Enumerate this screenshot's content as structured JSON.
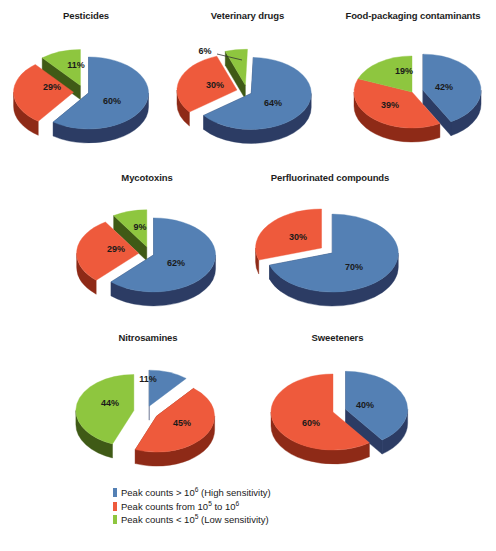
{
  "figure": {
    "background": "#ffffff",
    "width": 496,
    "height": 551
  },
  "colors": {
    "blue_top": "#5480b4",
    "blue_side": "#2c3c64",
    "red_top": "#ee5a3c",
    "red_side": "#8e2a17",
    "green_top": "#8dc councilor",
    "green_top_hex": "#8ec63f",
    "green_side": "#3f5a16"
  },
  "legend": {
    "items": [
      {
        "color": "#5480b4",
        "name": "legend-high-sensitivity",
        "text_pre": "Peak counts > 10",
        "sup": "6",
        "text_post": " (High sensitivity)"
      },
      {
        "color": "#ee5a3c",
        "name": "legend-mid-sensitivity",
        "text_pre": "Peak counts from 10",
        "sup": "5",
        "text_post": " to 10",
        "sup2": "6",
        "text_post2": ""
      },
      {
        "color": "#8ec63f",
        "name": "legend-low-sensitivity",
        "text_pre": "Peak counts < 10",
        "sup": "5",
        "text_post": " (Low sensitivity)"
      }
    ]
  },
  "chart_data": [
    {
      "type": "pie",
      "title": "Pesticides",
      "categories": [
        "Peak counts > 10^6 (High sensitivity)",
        "Peak counts from 10^5 to 10^6",
        "Peak counts < 10^5 (Low sensitivity)"
      ],
      "labels": [
        "60%",
        "29%",
        "11%"
      ],
      "values": [
        60,
        29,
        11
      ],
      "colors": [
        "#5480b4",
        "#ee5a3c",
        "#8ec63f"
      ],
      "exploded": [
        false,
        true,
        true
      ],
      "legend_position": "bottom"
    },
    {
      "type": "pie",
      "title": "Veterinary drugs",
      "categories": [
        "Peak counts > 10^6 (High sensitivity)",
        "Peak counts from 10^5 to 10^6",
        "Peak counts < 10^5 (Low sensitivity)"
      ],
      "labels": [
        "64%",
        "30%",
        "6%"
      ],
      "values": [
        64,
        30,
        6
      ],
      "colors": [
        "#5480b4",
        "#ee5a3c",
        "#8ec63f"
      ],
      "exploded": [
        false,
        true,
        true
      ],
      "legend_position": "bottom"
    },
    {
      "type": "pie",
      "title": "Food-packaging contaminants",
      "categories": [
        "Peak counts > 10^6 (High sensitivity)",
        "Peak counts from 10^5 to 10^6",
        "Peak counts < 10^5 (Low sensitivity)"
      ],
      "labels": [
        "42%",
        "39%",
        "19%"
      ],
      "values": [
        42,
        39,
        19
      ],
      "colors": [
        "#5480b4",
        "#ee5a3c",
        "#8ec63f"
      ],
      "exploded": [
        true,
        false,
        false
      ],
      "legend_position": "bottom"
    },
    {
      "type": "pie",
      "title": "Mycotoxins",
      "categories": [
        "Peak counts > 10^6 (High sensitivity)",
        "Peak counts from 10^5 to 10^6",
        "Peak counts < 10^5 (Low sensitivity)"
      ],
      "labels": [
        "62%",
        "29%",
        "9%"
      ],
      "values": [
        62,
        29,
        9
      ],
      "colors": [
        "#5480b4",
        "#ee5a3c",
        "#8ec63f"
      ],
      "exploded": [
        false,
        true,
        true
      ],
      "legend_position": "bottom"
    },
    {
      "type": "pie",
      "title": "Perfluorinated compounds",
      "categories": [
        "Peak counts > 10^6 (High sensitivity)",
        "Peak counts from 10^5 to 10^6"
      ],
      "labels": [
        "70%",
        "30%"
      ],
      "values": [
        70,
        30
      ],
      "colors": [
        "#5480b4",
        "#ee5a3c"
      ],
      "exploded": [
        false,
        true
      ],
      "legend_position": "bottom"
    },
    {
      "type": "pie",
      "title": "Nitrosamines",
      "categories": [
        "Peak counts > 10^6 (High sensitivity)",
        "Peak counts from 10^5 to 10^6",
        "Peak counts < 10^5 (Low sensitivity)"
      ],
      "labels": [
        "11%",
        "45%",
        "44%"
      ],
      "values": [
        11,
        45,
        44
      ],
      "colors": [
        "#5480b4",
        "#ee5a3c",
        "#8ec63f"
      ],
      "exploded": [
        true,
        true,
        true
      ],
      "legend_position": "bottom"
    },
    {
      "type": "pie",
      "title": "Sweeteners",
      "categories": [
        "Peak counts > 10^6 (High sensitivity)",
        "Peak counts from 10^5 to 10^6"
      ],
      "labels": [
        "40%",
        "60%"
      ],
      "values": [
        40,
        60
      ],
      "colors": [
        "#5480b4",
        "#ee5a3c"
      ],
      "exploded": [
        true,
        false
      ],
      "legend_position": "bottom"
    }
  ],
  "panels": [
    {
      "name": "pie-pesticides",
      "title": "Pesticides",
      "box": {
        "left": 6,
        "top": 10,
        "width": 160,
        "height": 145
      },
      "cx": 78,
      "cy": 82,
      "rx": 60,
      "ry": 36,
      "depth": 14,
      "start_angle": -90,
      "slices": [
        {
          "label": "60%",
          "value": 60,
          "color_top": "#5480b4",
          "color_side": "#2c3c64",
          "explode": 5,
          "lx": 28,
          "ly": 10
        },
        {
          "label": "29%",
          "value": 29,
          "color_top": "#ee5a3c",
          "color_side": "#8e2a17",
          "explode": 11,
          "lx": -32,
          "ly": -4
        },
        {
          "label": "11%",
          "value": 11,
          "color_top": "#8ec63f",
          "color_side": "#3f5a16",
          "explode": 11,
          "lx": -8,
          "ly": -26
        }
      ],
      "leader": null
    },
    {
      "name": "pie-veterinary-drugs",
      "title": "Veterinary drugs",
      "box": {
        "left": 165,
        "top": 10,
        "width": 165,
        "height": 145
      },
      "cx": 82,
      "cy": 82,
      "rx": 60,
      "ry": 36,
      "depth": 14,
      "start_angle": -88,
      "slices": [
        {
          "label": "64%",
          "value": 64,
          "color_top": "#5480b4",
          "color_side": "#2c3c64",
          "explode": 5,
          "lx": 26,
          "ly": 12
        },
        {
          "label": "30%",
          "value": 30,
          "color_top": "#ee5a3c",
          "color_side": "#8e2a17",
          "explode": 11,
          "lx": -32,
          "ly": -6
        },
        {
          "label": "6%",
          "value": 6,
          "color_top": "#8ec63f",
          "color_side": "#3f5a16",
          "explode": 11,
          "lx": -42,
          "ly": -40
        }
      ],
      "leader": {
        "x1": -30,
        "y1": -38,
        "x2": -5,
        "y2": -32
      }
    },
    {
      "name": "pie-food-packaging-contaminants",
      "title": "Food-packaging contaminants",
      "box": {
        "left": 330,
        "top": 10,
        "width": 166,
        "height": 150
      },
      "cx": 82,
      "cy": 82,
      "rx": 58,
      "ry": 36,
      "depth": 14,
      "start_angle": -90,
      "slices": [
        {
          "label": "42%",
          "value": 42,
          "color_top": "#5480b4",
          "color_side": "#2c3c64",
          "explode": 12,
          "lx": 32,
          "ly": -4
        },
        {
          "label": "39%",
          "value": 39,
          "color_top": "#ee5a3c",
          "color_side": "#8e2a17",
          "explode": 0,
          "lx": -22,
          "ly": 14
        },
        {
          "label": "19%",
          "value": 19,
          "color_top": "#8ec63f",
          "color_side": "#3f5a16",
          "explode": 0,
          "lx": -8,
          "ly": -20
        }
      ],
      "leader": null
    },
    {
      "name": "pie-mycotoxins",
      "title": "Mycotoxins",
      "box": {
        "left": 62,
        "top": 172,
        "width": 170,
        "height": 145
      },
      "cx": 88,
      "cy": 82,
      "rx": 62,
      "ry": 37,
      "depth": 14,
      "start_angle": -90,
      "slices": [
        {
          "label": "62%",
          "value": 62,
          "color_top": "#5480b4",
          "color_side": "#2c3c64",
          "explode": 4,
          "lx": 26,
          "ly": 10
        },
        {
          "label": "29%",
          "value": 29,
          "color_top": "#ee5a3c",
          "color_side": "#8e2a17",
          "explode": 12,
          "lx": -34,
          "ly": -4
        },
        {
          "label": "9%",
          "value": 9,
          "color_top": "#8ec63f",
          "color_side": "#3f5a16",
          "explode": 12,
          "lx": -10,
          "ly": -26
        }
      ],
      "leader": null
    },
    {
      "name": "pie-perfluorinated-compounds",
      "title": "Perfluorinated compounds",
      "box": {
        "left": 240,
        "top": 172,
        "width": 180,
        "height": 145
      },
      "cx": 90,
      "cy": 80,
      "rx": 66,
      "ry": 39,
      "depth": 14,
      "start_angle": -90,
      "slices": [
        {
          "label": "70%",
          "value": 70,
          "color_top": "#5480b4",
          "color_side": "#2c3c64",
          "explode": 3,
          "lx": 24,
          "ly": 16
        },
        {
          "label": "30%",
          "value": 30,
          "color_top": "#ee5a3c",
          "color_side": "#8e2a17",
          "explode": 11,
          "lx": -32,
          "ly": -14
        }
      ],
      "leader": null
    },
    {
      "name": "pie-nitrosamines",
      "title": "Nitrosamines",
      "box": {
        "left": 58,
        "top": 332,
        "width": 180,
        "height": 150
      },
      "cx": 88,
      "cy": 80,
      "rx": 58,
      "ry": 36,
      "depth": 14,
      "start_angle": -90,
      "slices": [
        {
          "label": "11%",
          "value": 11,
          "color_top": "#5480b4",
          "color_side": "#2c3c64",
          "explode": 10,
          "lx": 2,
          "ly": -32
        },
        {
          "label": "45%",
          "value": 45,
          "color_top": "#ee5a3c",
          "color_side": "#8e2a17",
          "explode": 13,
          "lx": 36,
          "ly": 12
        },
        {
          "label": "44%",
          "value": 44,
          "color_top": "#8ec63f",
          "color_side": "#3f5a16",
          "explode": 13,
          "lx": -36,
          "ly": -8
        }
      ],
      "leader": null
    },
    {
      "name": "pie-sweeteners",
      "title": "Sweeteners",
      "box": {
        "left": 245,
        "top": 332,
        "width": 185,
        "height": 150
      },
      "cx": 88,
      "cy": 80,
      "rx": 62,
      "ry": 38,
      "depth": 14,
      "start_angle": -90,
      "slices": [
        {
          "label": "40%",
          "value": 40,
          "color_top": "#5480b4",
          "color_side": "#2c3c64",
          "explode": 14,
          "lx": 32,
          "ly": -6
        },
        {
          "label": "60%",
          "value": 60,
          "color_top": "#ee5a3c",
          "color_side": "#8e2a17",
          "explode": 0,
          "lx": -22,
          "ly": 12
        }
      ],
      "leader": null
    }
  ]
}
